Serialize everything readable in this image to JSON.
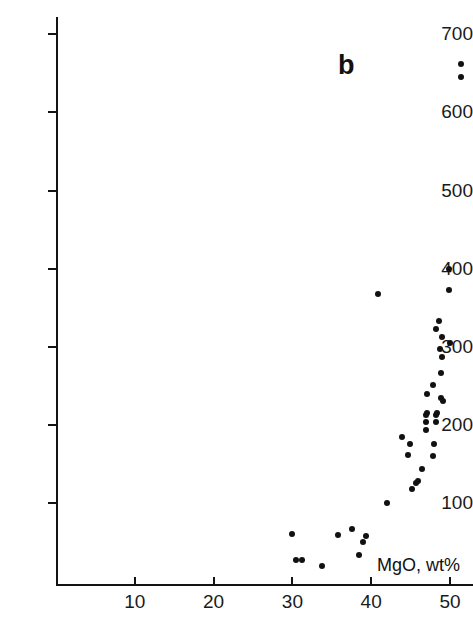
{
  "figure": {
    "panel_label": "b",
    "background_color": "#ffffff",
    "marker_color": "#111111",
    "axis_color": "#141414"
  },
  "axes": {
    "x_title": "MgO, wt%",
    "y_title": "",
    "x_ticks": [
      10,
      20,
      30,
      40,
      50
    ],
    "y_ticks": [
      100,
      200,
      300,
      400,
      500,
      600,
      700
    ],
    "x_tick_labels": [
      "10",
      "20",
      "30",
      "40",
      "50"
    ],
    "y_tick_labels": [
      "100",
      "200",
      "300",
      "400",
      "500",
      "600",
      "700"
    ],
    "xlim": [
      0,
      52.7
    ],
    "ylim": [
      -6,
      700
    ]
  },
  "chart_data": {
    "type": "scatter",
    "title": "b",
    "xlabel": "MgO, wt%",
    "ylabel": "",
    "xlim": [
      0,
      52.7
    ],
    "ylim": [
      -6,
      700
    ],
    "grid": false,
    "legend": null,
    "x_ticks": [
      10,
      20,
      30,
      40,
      50
    ],
    "y_ticks": [
      100,
      200,
      300,
      400,
      500,
      600,
      700
    ],
    "points": [
      {
        "x": 51.4,
        "y": 662
      },
      {
        "x": 51.4,
        "y": 645
      },
      {
        "x": 49.9,
        "y": 399
      },
      {
        "x": 40.9,
        "y": 367
      },
      {
        "x": 49.9,
        "y": 372
      },
      {
        "x": 48.6,
        "y": 333
      },
      {
        "x": 48.2,
        "y": 323
      },
      {
        "x": 49.0,
        "y": 312
      },
      {
        "x": 50.0,
        "y": 305
      },
      {
        "x": 48.7,
        "y": 297
      },
      {
        "x": 49.0,
        "y": 287
      },
      {
        "x": 48.9,
        "y": 266
      },
      {
        "x": 47.9,
        "y": 251
      },
      {
        "x": 47.1,
        "y": 240
      },
      {
        "x": 48.9,
        "y": 234
      },
      {
        "x": 49.1,
        "y": 231
      },
      {
        "x": 47.1,
        "y": 215
      },
      {
        "x": 48.3,
        "y": 215
      },
      {
        "x": 46.9,
        "y": 212
      },
      {
        "x": 48.2,
        "y": 212
      },
      {
        "x": 47.0,
        "y": 203
      },
      {
        "x": 48.2,
        "y": 203
      },
      {
        "x": 46.9,
        "y": 193
      },
      {
        "x": 43.9,
        "y": 185
      },
      {
        "x": 44.9,
        "y": 175
      },
      {
        "x": 48.0,
        "y": 175
      },
      {
        "x": 44.7,
        "y": 161
      },
      {
        "x": 47.9,
        "y": 160
      },
      {
        "x": 46.4,
        "y": 143
      },
      {
        "x": 46.0,
        "y": 128
      },
      {
        "x": 45.7,
        "y": 125
      },
      {
        "x": 45.2,
        "y": 118
      },
      {
        "x": 42.0,
        "y": 100
      },
      {
        "x": 30.0,
        "y": 60
      },
      {
        "x": 35.8,
        "y": 59
      },
      {
        "x": 37.6,
        "y": 67
      },
      {
        "x": 39.4,
        "y": 57
      },
      {
        "x": 38.9,
        "y": 50
      },
      {
        "x": 38.5,
        "y": 33
      },
      {
        "x": 30.4,
        "y": 27
      },
      {
        "x": 31.2,
        "y": 27
      },
      {
        "x": 33.8,
        "y": 19
      }
    ]
  }
}
